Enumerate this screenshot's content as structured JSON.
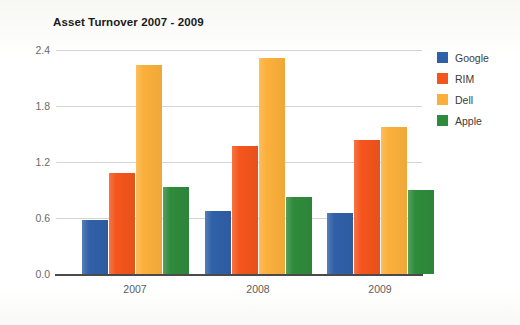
{
  "chart_data": {
    "type": "bar",
    "title": "Asset Turnover 2007 - 2009",
    "xlabel": "",
    "ylabel": "",
    "categories": [
      "2007",
      "2008",
      "2009"
    ],
    "series": [
      {
        "name": "Google",
        "color": "#3060a8",
        "values": [
          0.58,
          0.68,
          0.65
        ]
      },
      {
        "name": "RIM",
        "color": "#f4551c",
        "values": [
          1.08,
          1.37,
          1.44
        ]
      },
      {
        "name": "Dell",
        "color": "#fbb03b",
        "values": [
          2.24,
          2.31,
          1.57
        ]
      },
      {
        "name": "Apple",
        "color": "#2f8b3c",
        "values": [
          0.93,
          0.82,
          0.9
        ]
      }
    ],
    "ylim": [
      0.0,
      2.4
    ],
    "yticks": [
      "0.0",
      "0.6",
      "1.2",
      "1.8",
      "2.4"
    ],
    "ytick_values": [
      0.0,
      0.6,
      1.2,
      1.8,
      2.4
    ],
    "grid": true,
    "legend_position": "right"
  }
}
